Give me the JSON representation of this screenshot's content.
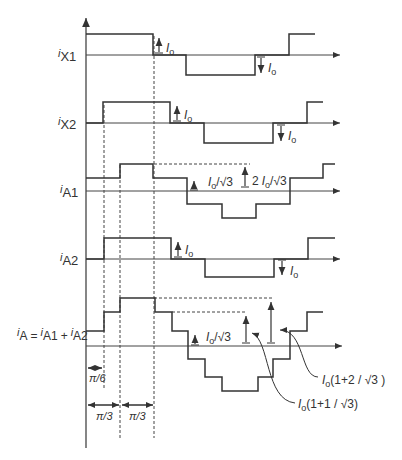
{
  "diagram": {
    "traces": [
      {
        "id": "iX1",
        "label_main": "i",
        "label_sub": "X1",
        "annotations": [
          {
            "text": "Io",
            "dir": "up"
          },
          {
            "text": "Io",
            "dir": "down"
          }
        ]
      },
      {
        "id": "iX2",
        "label_main": "i",
        "label_sub": "X2",
        "annotations": [
          {
            "text": "Io",
            "dir": "up"
          },
          {
            "text": "Io",
            "dir": "down"
          }
        ]
      },
      {
        "id": "iA1",
        "label_main": "i",
        "label_sub": "A1",
        "annotations": [
          {
            "text": "Io/√3"
          },
          {
            "text": "2 Io/√3"
          }
        ]
      },
      {
        "id": "iA2",
        "label_main": "i",
        "label_sub": "A2",
        "annotations": [
          {
            "text": "Io",
            "dir": "up"
          },
          {
            "text": "Io",
            "dir": "down"
          }
        ]
      },
      {
        "id": "iA",
        "label_main": "i",
        "label_sub": "A",
        "equation": "= iA1 + iA2",
        "annotations": [
          {
            "text": "Io/√3"
          },
          {
            "text": "Io(1+1/√3)"
          },
          {
            "text": "Io(1+2/√3)"
          }
        ]
      }
    ],
    "labels": {
      "iX1_sub": "X1",
      "iX2_sub": "X2",
      "iA1_sub": "A1",
      "iA2_sub": "A2",
      "iA_sub": "A",
      "iA_eq_sub1": "A1",
      "iA_eq_sub2": "A2",
      "i": "i",
      "eq": "=",
      "plus": "+",
      "Io": "I",
      "o": "o",
      "sqrt3": "√3",
      "Io_sqrt3": "/√3",
      "two": "2",
      "iA_top": "(1+2 / √3 )",
      "iA_mid": "(1+1 / √3)",
      "pi6": "π/6",
      "pi3_a": "π/3",
      "pi3_b": "π/3"
    }
  }
}
